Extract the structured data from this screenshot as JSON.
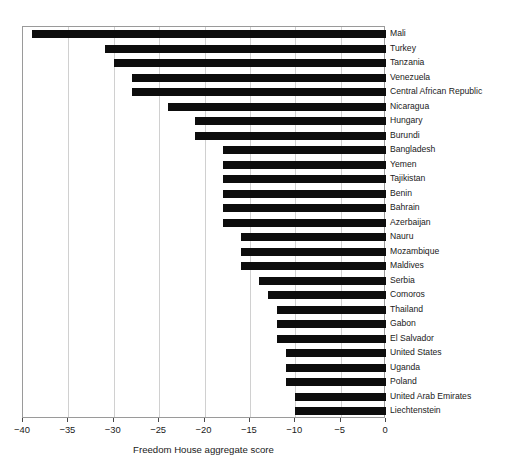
{
  "chart_data": {
    "type": "bar",
    "orientation": "horizontal",
    "title": "",
    "xlabel": "Freedom House aggregate score",
    "ylabel": "",
    "xlim": [
      -40,
      0
    ],
    "ylim": null,
    "grid": true,
    "legend": null,
    "xticks": [
      -40,
      -35,
      -30,
      -25,
      -20,
      -15,
      -10,
      -5,
      0
    ],
    "xtick_labels": [
      "−40",
      "−35",
      "−30",
      "−25",
      "−20",
      "−15",
      "−10",
      "−5",
      "0"
    ],
    "categories": [
      "Mali",
      "Turkey",
      "Tanzania",
      "Venezuela",
      "Central African Republic",
      "Nicaragua",
      "Hungary",
      "Burundi",
      "Bangladesh",
      "Yemen",
      "Tajikistan",
      "Benin",
      "Bahrain",
      "Azerbaijan",
      "Nauru",
      "Mozambique",
      "Maldives",
      "Serbia",
      "Comoros",
      "Thailand",
      "Gabon",
      "El Salvador",
      "United States",
      "Uganda",
      "Poland",
      "United Arab Emirates",
      "Liechtenstein"
    ],
    "values": [
      -39,
      -31,
      -30,
      -28,
      -28,
      -24,
      -21,
      -21,
      -18,
      -18,
      -18,
      -18,
      -18,
      -18,
      -16,
      -16,
      -16,
      -14,
      -13,
      -12,
      -12,
      -12,
      -11,
      -11,
      -11,
      -10,
      -10
    ],
    "bar_color": "#0d0d0d",
    "grid_color": "#d0d0d0",
    "frame_color": "#9a9a9a",
    "background": "#ffffff"
  }
}
